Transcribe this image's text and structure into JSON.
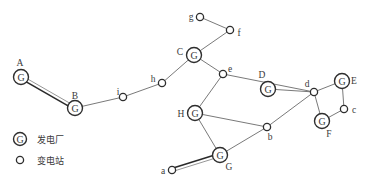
{
  "diagram": {
    "type": "power-network",
    "plant_glyph": "G",
    "plants": [
      {
        "id": "A",
        "label": "A",
        "x": 21,
        "y": 77,
        "lx": 20,
        "ly": 63
      },
      {
        "id": "B",
        "label": "B",
        "x": 75,
        "y": 108,
        "lx": 75,
        "ly": 96
      },
      {
        "id": "C",
        "label": "C",
        "x": 194,
        "y": 55,
        "lx": 180,
        "ly": 52
      },
      {
        "id": "D",
        "label": "D",
        "x": 268,
        "y": 89,
        "lx": 262,
        "ly": 75
      },
      {
        "id": "E",
        "label": "E",
        "x": 342,
        "y": 81,
        "lx": 354,
        "ly": 81
      },
      {
        "id": "F",
        "label": "F",
        "x": 322,
        "y": 121,
        "lx": 329,
        "ly": 134
      },
      {
        "id": "G",
        "label": "G",
        "x": 220,
        "y": 155,
        "lx": 229,
        "ly": 167
      },
      {
        "id": "H",
        "label": "H",
        "x": 195,
        "y": 113,
        "lx": 181,
        "ly": 114
      }
    ],
    "substations": [
      {
        "id": "a",
        "label": "a",
        "x": 172,
        "y": 170,
        "lx": 163,
        "ly": 171
      },
      {
        "id": "b",
        "label": "b",
        "x": 267,
        "y": 127,
        "lx": 270,
        "ly": 137
      },
      {
        "id": "c",
        "label": "c",
        "x": 344,
        "y": 109,
        "lx": 354,
        "ly": 110
      },
      {
        "id": "d",
        "label": "d",
        "x": 314,
        "y": 92,
        "lx": 307,
        "ly": 84
      },
      {
        "id": "e",
        "label": "e",
        "x": 223,
        "y": 74,
        "lx": 230,
        "ly": 69
      },
      {
        "id": "f",
        "label": "f",
        "x": 230,
        "y": 30,
        "lx": 239,
        "ly": 33
      },
      {
        "id": "g",
        "label": "g",
        "x": 200,
        "y": 17,
        "lx": 191,
        "ly": 17
      },
      {
        "id": "h",
        "label": "h",
        "x": 162,
        "y": 83,
        "lx": 153,
        "ly": 79
      },
      {
        "id": "i",
        "label": "i",
        "x": 123,
        "y": 97,
        "lx": 118,
        "ly": 92
      }
    ],
    "edges": [
      {
        "from": "A",
        "to": "B",
        "style": "double"
      },
      {
        "from": "B",
        "to": "i",
        "style": "single"
      },
      {
        "from": "i",
        "to": "h",
        "style": "single"
      },
      {
        "from": "h",
        "to": "C",
        "style": "single"
      },
      {
        "from": "C",
        "to": "f",
        "style": "single"
      },
      {
        "from": "f",
        "to": "g",
        "style": "single"
      },
      {
        "from": "C",
        "to": "e",
        "style": "single"
      },
      {
        "from": "e",
        "to": "d",
        "style": "single"
      },
      {
        "from": "e",
        "to": "H",
        "style": "single"
      },
      {
        "from": "D",
        "to": "d",
        "style": "single"
      },
      {
        "from": "H",
        "to": "b",
        "style": "single"
      },
      {
        "from": "H",
        "to": "G",
        "style": "single"
      },
      {
        "from": "G",
        "to": "b",
        "style": "single"
      },
      {
        "from": "b",
        "to": "d",
        "style": "single"
      },
      {
        "from": "d",
        "to": "E",
        "style": "single"
      },
      {
        "from": "d",
        "to": "F",
        "style": "single"
      },
      {
        "from": "E",
        "to": "c",
        "style": "single"
      },
      {
        "from": "c",
        "to": "F",
        "style": "single"
      },
      {
        "from": "G",
        "to": "a",
        "style": "double"
      }
    ]
  },
  "legend": {
    "items": [
      {
        "symbol": "G",
        "kind": "plant",
        "label": "发电厂"
      },
      {
        "symbol": "",
        "kind": "substation",
        "label": "变电站"
      }
    ]
  }
}
